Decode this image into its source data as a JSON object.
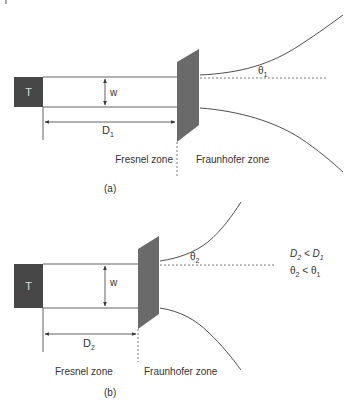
{
  "colors": {
    "transmitter_fill": "#474747",
    "plate_fill": "#6a6a6a",
    "line": "#3a3a3a",
    "text": "#333333",
    "background": "#ffffff"
  },
  "panel_a": {
    "caption": "(a)",
    "transmitter_label": "T",
    "width_label": "w",
    "distance_label": "D",
    "distance_sub": "1",
    "angle_label": "θ",
    "angle_sub": "1",
    "fresnel_label": "Fresnel zone",
    "fraunhofer_label": "Fraunhofer zone"
  },
  "panel_b": {
    "caption": "(b)",
    "transmitter_label": "T",
    "width_label": "w",
    "distance_label": "D",
    "distance_sub": "2",
    "angle_label": "θ",
    "angle_sub": "2",
    "fresnel_label": "Fresnel zone",
    "fraunhofer_label": "Fraunhofer zone",
    "relations": {
      "line1_a": "D",
      "line1_a_sub": "2",
      "line1_op": " < ",
      "line1_b": "D",
      "line1_b_sub": "1",
      "line2_a": "θ",
      "line2_a_sub": "2",
      "line2_op": " < ",
      "line2_b": "θ",
      "line2_b_sub": "1"
    }
  }
}
